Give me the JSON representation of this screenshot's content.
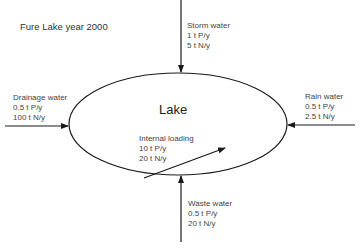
{
  "title": "Fure Lake year 2000",
  "lake": {
    "label": "Lake"
  },
  "flows": [
    {
      "id": "storm-water",
      "name": "Storm water",
      "phosphorus": "1 t P/y",
      "nitrogen": "5 t N/y",
      "direction": "in",
      "side": "top"
    },
    {
      "id": "drainage-water",
      "name": "Drainage water",
      "phosphorus": "0.5 t P/y",
      "nitrogen": "100 t N/y",
      "direction": "in",
      "side": "left"
    },
    {
      "id": "rain-water",
      "name": "Rain water",
      "phosphorus": "0.5 t P/y",
      "nitrogen": "2.5 t N/y",
      "direction": "in",
      "side": "right"
    },
    {
      "id": "internal-loading",
      "name": "Internal loading",
      "phosphorus": "10 t P/y",
      "nitrogen": "20 t N/y",
      "direction": "internal",
      "side": "inside"
    },
    {
      "id": "waste-water",
      "name": "Waste water",
      "phosphorus": "0.5 t P/y",
      "nitrogen": "20 t N/y",
      "direction": "in",
      "side": "bottom"
    }
  ],
  "colors": {
    "stroke": "#1a1a1a",
    "text": "#444444",
    "background": "#ffffff"
  }
}
